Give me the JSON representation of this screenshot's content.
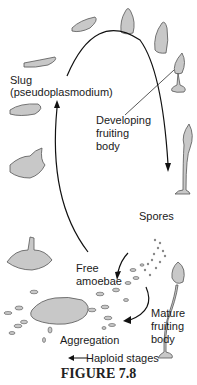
{
  "labels": {
    "slug": "Slug",
    "slug_sub": "(pseudoplasmodium)",
    "developing_1": "Developing",
    "developing_2": "fruiting",
    "developing_3": "body",
    "spores": "Spores",
    "free_1": "Free",
    "free_2": "amoebae",
    "mature_1": "Mature",
    "mature_2": "fruiting",
    "mature_3": "body",
    "aggregation": "Aggregation",
    "legend": "← Haploid stages"
  },
  "caption": "FIGURE 7.8",
  "colors": {
    "fill": "#c8c8c8",
    "stroke": "#555555",
    "line": "#111111"
  }
}
